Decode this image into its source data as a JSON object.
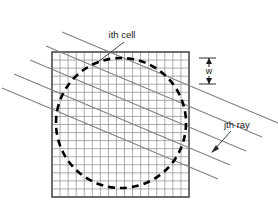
{
  "figure": {
    "name": "reconstruction-grid-ray-diagram",
    "background_color": "#ffffff",
    "width": 278,
    "height": 218
  },
  "labels": {
    "ith_cell": "ith cell",
    "jth_ray": "jth ray",
    "cell_width": "w"
  },
  "colors": {
    "grid_line": "#8a8a8a",
    "grid_border": "#4a4a4a",
    "circle_dash": "#000000",
    "ray_line": "#8a8a8a",
    "leader_line": "#2a2a2a",
    "text": "#1a1a1a"
  },
  "chart_data": {
    "type": "diagram",
    "title": "",
    "grid": {
      "x0": 52,
      "y0": 52,
      "x1": 189,
      "y1": 197,
      "columns": 17,
      "rows": 18,
      "cell_size": 8.06,
      "cell_label": "w"
    },
    "circle": {
      "cx": 121,
      "cy": 123,
      "r": 65,
      "style": "dashed",
      "dash_pattern": "7 5",
      "stroke_width": 2.6
    },
    "rays": {
      "count": 5,
      "slope": -0.42,
      "angle_degrees": 22.8,
      "spacing": 14,
      "stroke_width": 0.9,
      "endpoints": [
        {
          "x1": 14,
          "y1": 74,
          "x2": 230,
          "y2": 165
        },
        {
          "x1": 30,
          "y1": 60,
          "x2": 246,
          "y2": 151
        },
        {
          "x1": 46,
          "y1": 46,
          "x2": 262,
          "y2": 137
        },
        {
          "x1": 62,
          "y1": 32,
          "x2": 278,
          "y2": 123
        },
        {
          "x1": 2,
          "y1": 88,
          "x2": 218,
          "y2": 179
        }
      ]
    },
    "annotations": [
      {
        "id": "ith-cell",
        "text": "ith cell",
        "text_x": 122,
        "text_y": 38,
        "leader_from": [
          124,
          42
        ],
        "leader_to": [
          98,
          62
        ]
      },
      {
        "id": "jth-ray",
        "text": "jth ray",
        "text_x": 224,
        "text_y": 128,
        "leader_from": [
          230,
          132
        ],
        "leader_to": [
          212,
          152
        ]
      },
      {
        "id": "cell-width",
        "text": "w",
        "text_x": 208,
        "text_y": 74,
        "arrow_top_y": 58,
        "arrow_bottom_y": 84,
        "arrow_x": 209
      }
    ]
  }
}
